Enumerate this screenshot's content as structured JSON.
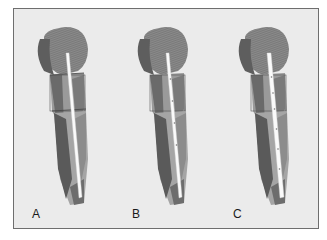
{
  "figure": {
    "background": "#ebebeb",
    "border_color": "#6e6e6e",
    "panels": [
      {
        "label": "A",
        "strip_markers": 0
      },
      {
        "label": "B",
        "strip_markers": 4
      },
      {
        "label": "C",
        "strip_markers": 6
      }
    ]
  }
}
